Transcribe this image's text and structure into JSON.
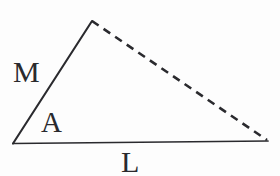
{
  "figure": {
    "kind": "geometry-diagram",
    "background_color": "#fdfdfd",
    "stroke_color": "#2a2a2e",
    "label_color": "#2a2a2e",
    "canvas": {
      "width": 280,
      "height": 176
    },
    "vertices": {
      "left": {
        "x": 13,
        "y": 143
      },
      "apex": {
        "x": 92,
        "y": 21
      },
      "right": {
        "x": 267,
        "y": 140
      }
    },
    "edges": [
      {
        "name": "side-M",
        "style": "solid",
        "from": "left",
        "to": "apex",
        "stroke_width": 2.1,
        "label": "M"
      },
      {
        "name": "hypotenuse",
        "style": "dashed",
        "from": "apex",
        "to": "right",
        "stroke_width": 2.6,
        "dash_length": 8,
        "dash_gap": 6,
        "label": ""
      },
      {
        "name": "base-L",
        "style": "solid",
        "from": "left",
        "to": "right",
        "stroke_width": 1.7,
        "label": "L"
      }
    ],
    "labels": [
      {
        "name": "side-length-M",
        "text": "M",
        "x": 13,
        "y": 57,
        "font_size": 30
      },
      {
        "name": "angle-A",
        "text": "A",
        "x": 41,
        "y": 108,
        "font_size": 29
      },
      {
        "name": "side-length-L",
        "text": "L",
        "x": 121,
        "y": 147,
        "font_size": 30
      }
    ]
  }
}
